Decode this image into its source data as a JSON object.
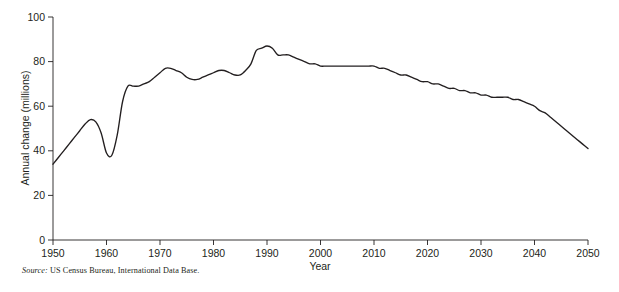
{
  "chart_data": {
    "type": "line",
    "title": "",
    "xlabel": "Year",
    "ylabel": "Annual change (millions)",
    "xlim": [
      1950,
      2050
    ],
    "ylim": [
      0,
      100
    ],
    "xticks": [
      1950,
      1960,
      1970,
      1980,
      1990,
      2000,
      2010,
      2020,
      2030,
      2040,
      2050
    ],
    "yticks": [
      0,
      20,
      40,
      60,
      80,
      100
    ],
    "xtick_labels": [
      "1950",
      "1960",
      "1970",
      "1980",
      "1990",
      "2000",
      "2010",
      "2020",
      "2030",
      "2040",
      "2050"
    ],
    "ytick_labels": [
      "0",
      "20",
      "40",
      "60",
      "80",
      "100"
    ],
    "grid": false,
    "legend": false,
    "line_color": "#231f20",
    "series": [
      {
        "name": "World annual population change",
        "x": [
          1950,
          1951,
          1952,
          1953,
          1954,
          1955,
          1956,
          1957,
          1958,
          1959,
          1960,
          1961,
          1962,
          1963,
          1964,
          1965,
          1966,
          1967,
          1968,
          1969,
          1970,
          1971,
          1972,
          1973,
          1974,
          1975,
          1976,
          1977,
          1978,
          1979,
          1980,
          1981,
          1982,
          1983,
          1984,
          1985,
          1986,
          1987,
          1988,
          1989,
          1990,
          1991,
          1992,
          1993,
          1994,
          1995,
          1996,
          1997,
          1998,
          1999,
          2000,
          2001,
          2002,
          2003,
          2004,
          2005,
          2006,
          2007,
          2008,
          2009,
          2010,
          2011,
          2012,
          2013,
          2014,
          2015,
          2016,
          2017,
          2018,
          2019,
          2020,
          2021,
          2022,
          2023,
          2024,
          2025,
          2026,
          2027,
          2028,
          2029,
          2030,
          2031,
          2032,
          2033,
          2034,
          2035,
          2036,
          2037,
          2038,
          2039,
          2040,
          2041,
          2042,
          2043,
          2044,
          2045,
          2046,
          2047,
          2048,
          2049,
          2050
        ],
        "values": [
          34,
          37,
          40,
          43,
          46,
          49,
          52,
          54,
          53,
          48,
          39,
          38,
          47,
          62,
          69,
          69,
          69,
          70,
          71,
          73,
          75,
          77,
          77,
          76,
          75,
          73,
          72,
          72,
          73,
          74,
          75,
          76,
          76,
          75,
          74,
          74,
          76,
          79,
          85,
          86,
          87,
          86,
          83,
          83,
          83,
          82,
          81,
          80,
          79,
          79,
          78,
          78,
          78,
          78,
          78,
          78,
          78,
          78,
          78,
          78,
          78,
          77,
          77,
          76,
          75,
          74,
          74,
          73,
          72,
          71,
          71,
          70,
          70,
          69,
          68,
          68,
          67,
          67,
          66,
          66,
          65,
          65,
          64,
          64,
          64,
          64,
          63,
          63,
          62,
          61,
          60,
          58,
          57,
          55,
          53,
          51,
          49,
          47,
          45,
          43,
          41
        ]
      }
    ],
    "annotations": {
      "peak_year": "1989",
      "peak_value": "87",
      "start_value": "34",
      "end_value": "41",
      "dip_year": "1961",
      "dip_value": "38"
    }
  },
  "source": {
    "prefix": "Source:",
    "text": " US Census Bureau, International Data Base."
  }
}
